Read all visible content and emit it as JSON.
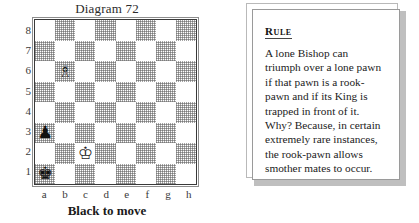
{
  "diagram": {
    "title": "Diagram 72",
    "caption": "Black to move",
    "rank_labels": [
      "8",
      "7",
      "6",
      "5",
      "4",
      "3",
      "2",
      "1"
    ],
    "file_labels": [
      "a",
      "b",
      "c",
      "d",
      "e",
      "f",
      "g",
      "h"
    ],
    "light_square_color": "#ffffff",
    "dark_square_color": "#a8a8a8",
    "border_color": "#3a3a3a"
  },
  "chart_data": {
    "type": "table",
    "title": "Diagram 72",
    "subtitle": "Black to move",
    "xlabel": "",
    "ylabel": "",
    "categories": [
      "a",
      "b",
      "c",
      "d",
      "e",
      "f",
      "g",
      "h"
    ],
    "rows": [
      "8",
      "7",
      "6",
      "5",
      "4",
      "3",
      "2",
      "1"
    ],
    "pieces": [
      {
        "square": "b6",
        "piece": "bishop",
        "color": "white",
        "glyph": "♗"
      },
      {
        "square": "a3",
        "piece": "pawn",
        "color": "black",
        "glyph": "♟"
      },
      {
        "square": "c2",
        "piece": "king",
        "color": "white",
        "glyph": "♔"
      },
      {
        "square": "a1",
        "piece": "king",
        "color": "black",
        "glyph": "♚"
      }
    ],
    "side_to_move": "black",
    "material": {
      "white": [
        "King c2",
        "Bishop b6"
      ],
      "black": [
        "King a1",
        "Pawn a3"
      ]
    }
  },
  "rule": {
    "heading": "Rule",
    "lines": [
      "A lone Bishop can",
      "triumph over a lone pawn",
      "if that pawn is a rook-",
      "pawn and if its King is",
      "trapped in front of it.",
      "Why? Because, in certain",
      "extremely rare instances,",
      "the rook-pawn allows",
      "smother mates to occur."
    ]
  }
}
